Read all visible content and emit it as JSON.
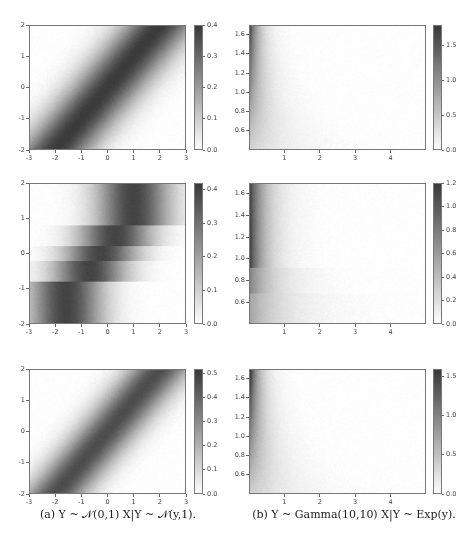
{
  "figure": {
    "captions": {
      "a": "(a) Y ~ 𝒩(0,1) X|Y ~ 𝒩(y,1).",
      "b": "(b) Y ~ Gamma(10,10) X|Y ~ Exp(y)."
    }
  },
  "chart_data": [
    {
      "id": "a1",
      "type": "heatmap",
      "column": "a",
      "row": 1,
      "title": "",
      "xlabel": "",
      "ylabel": "",
      "xlim": [
        -3,
        3
      ],
      "ylim": [
        -2,
        2
      ],
      "xticks": [
        "-3",
        "-2",
        "-1",
        "0",
        "1",
        "2",
        "3"
      ],
      "yticks": [
        "-2",
        "-1",
        "0",
        "1",
        "2"
      ],
      "colorbar": {
        "range": [
          0.0,
          0.4
        ],
        "ticks": [
          "0.0",
          "0.1",
          "0.2",
          "0.3",
          "0.4"
        ]
      },
      "description": "Joint density band along x = y, max ≈0.4",
      "model": "gauss_diag",
      "params": {
        "sigma": 1.0
      }
    },
    {
      "id": "b1",
      "type": "heatmap",
      "column": "b",
      "row": 1,
      "title": "",
      "xlabel": "",
      "ylabel": "",
      "xlim": [
        0,
        5
      ],
      "ylim": [
        0.4,
        1.7
      ],
      "xticks": [
        "1",
        "2",
        "3",
        "4"
      ],
      "yticks": [
        "0.6",
        "0.8",
        "1.0",
        "1.2",
        "1.4",
        "1.6"
      ],
      "colorbar": {
        "range": [
          0.0,
          1.8
        ],
        "ticks": [
          "0.0",
          "0.5",
          "1.0",
          "1.5"
        ]
      },
      "description": "Density concentrated at small x, decaying as exp(-y x)",
      "model": "exp",
      "params": {}
    },
    {
      "id": "a2",
      "type": "heatmap",
      "column": "a",
      "row": 2,
      "title": "",
      "xlabel": "",
      "ylabel": "",
      "xlim": [
        -3,
        3
      ],
      "ylim": [
        -2,
        2
      ],
      "xticks": [
        "-3",
        "-2",
        "-1",
        "0",
        "1",
        "2",
        "3"
      ],
      "yticks": [
        "-2",
        "-1",
        "0",
        "1",
        "2"
      ],
      "colorbar": {
        "range": [
          0.0,
          0.42
        ],
        "ticks": [
          "0.0",
          "0.1",
          "0.2",
          "0.3",
          "0.4"
        ]
      },
      "description": "Piecewise-constant (stepped) approximation of the diagonal band",
      "model": "gauss_steps",
      "params": {
        "sigma": 1.0,
        "steps": [
          {
            "y0": 0.8,
            "y1": 2.0,
            "mu": 1.0
          },
          {
            "y0": 0.2,
            "y1": 0.8,
            "mu": 0.3
          },
          {
            "y0": -0.2,
            "y1": 0.2,
            "mu": -0.25
          },
          {
            "y0": -0.8,
            "y1": -0.2,
            "mu": -0.7
          },
          {
            "y0": -2.0,
            "y1": -0.8,
            "mu": -1.6
          }
        ]
      }
    },
    {
      "id": "b2",
      "type": "heatmap",
      "column": "b",
      "row": 2,
      "title": "",
      "xlabel": "",
      "ylabel": "",
      "xlim": [
        0,
        5
      ],
      "ylim": [
        0.4,
        1.7
      ],
      "xticks": [
        "1",
        "2",
        "3",
        "4"
      ],
      "yticks": [
        "0.6",
        "0.8",
        "1.0",
        "1.2",
        "1.4",
        "1.6"
      ],
      "colorbar": {
        "range": [
          0.0,
          1.2
        ],
        "ticks": [
          "0.0",
          "0.2",
          "0.4",
          "0.6",
          "0.8",
          "1.0",
          "1.2"
        ]
      },
      "description": "Stepped approximation: darker region above y≈0.92, lighter bands below",
      "model": "exp_steps",
      "params": {
        "steps": [
          {
            "y0": 0.92,
            "y1": 1.7,
            "rate": 1.15
          },
          {
            "y0": 0.68,
            "y1": 0.92,
            "rate": 0.75
          },
          {
            "y0": 0.4,
            "y1": 0.68,
            "rate": 0.55
          }
        ]
      }
    },
    {
      "id": "a3",
      "type": "heatmap",
      "column": "a",
      "row": 3,
      "title": "",
      "xlabel": "",
      "ylabel": "",
      "xlim": [
        -3,
        3
      ],
      "ylim": [
        -2,
        2
      ],
      "xticks": [
        "-3",
        "-2",
        "-1",
        "0",
        "1",
        "2",
        "3"
      ],
      "yticks": [
        "-2",
        "-1",
        "0",
        "1",
        "2"
      ],
      "colorbar": {
        "range": [
          0.0,
          0.52
        ],
        "ticks": [
          "0.0",
          "0.1",
          "0.2",
          "0.3",
          "0.4",
          "0.5"
        ]
      },
      "description": "Smooth learned approximation of the diagonal band, max ≈0.52",
      "model": "gauss_diag",
      "params": {
        "sigma": 0.85
      }
    },
    {
      "id": "b3",
      "type": "heatmap",
      "column": "b",
      "row": 3,
      "title": "",
      "xlabel": "",
      "ylabel": "",
      "xlim": [
        0,
        5
      ],
      "ylim": [
        0.4,
        1.7
      ],
      "xticks": [
        "1",
        "2",
        "3",
        "4"
      ],
      "yticks": [
        "0.6",
        "0.8",
        "1.0",
        "1.2",
        "1.4",
        "1.6"
      ],
      "colorbar": {
        "range": [
          0.0,
          1.6
        ],
        "ticks": [
          "0.0",
          "0.5",
          "1.0",
          "1.5"
        ]
      },
      "description": "Smooth learned approximation of exponential density",
      "model": "exp",
      "params": {}
    }
  ],
  "layout": {
    "a": {
      "plotLeft": 29,
      "plotWidth": 157,
      "cbarLeft": 194,
      "cbarWidth": 9
    },
    "b": {
      "plotLeft": 249,
      "plotWidth": 177,
      "cbarLeft": 433,
      "cbarWidth": 9
    },
    "rows": [
      {
        "top": 25,
        "height": 125
      },
      {
        "top": 183,
        "height": 141
      },
      {
        "top": 369,
        "height": 125
      }
    ]
  }
}
